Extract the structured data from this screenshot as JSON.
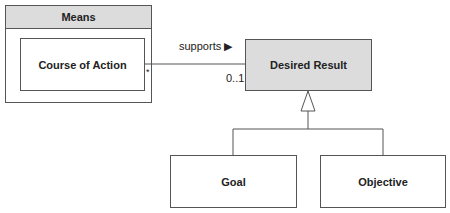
{
  "diagram": {
    "package": {
      "title": "Means"
    },
    "classes": {
      "course_of_action": "Course of Action",
      "desired_result": "Desired Result",
      "goal": "Goal",
      "objective": "Objective"
    },
    "association": {
      "label": "supports ▶",
      "source_multiplicity": "*",
      "target_multiplicity": "0..1"
    },
    "colors": {
      "shaded": "#dcdcdc",
      "line": "#555555"
    }
  }
}
